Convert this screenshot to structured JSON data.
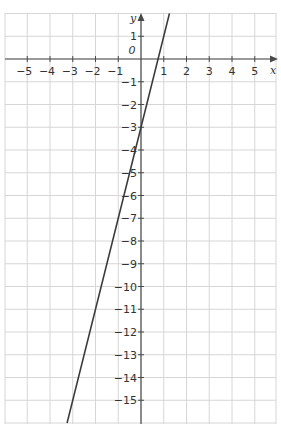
{
  "chart_data": {
    "type": "line",
    "title": "",
    "xlabel": "x",
    "ylabel": "y",
    "origin_label": "0",
    "xlim": [
      -6,
      6
    ],
    "ylim": [
      -16,
      2
    ],
    "grid": true,
    "x_ticks": [
      -5,
      -4,
      -3,
      -2,
      -1,
      1,
      2,
      3,
      4,
      5
    ],
    "y_ticks": [
      1,
      -1,
      -2,
      -3,
      -4,
      -5,
      -6,
      -7,
      -8,
      -9,
      -10,
      -11,
      -12,
      -13,
      -14,
      -15
    ],
    "series": [
      {
        "name": "y = 4x - 3",
        "equation": "y = 4x - 3",
        "slope": 4,
        "intercept": -3,
        "points": [
          [
            -3.25,
            -16
          ],
          [
            1.25,
            2
          ]
        ],
        "color": "#3a3a3a"
      }
    ],
    "colors": {
      "grid": "#d6d6d6",
      "axis": "#4a4a4a",
      "line": "#3a3a3a",
      "text": "#333333"
    }
  }
}
